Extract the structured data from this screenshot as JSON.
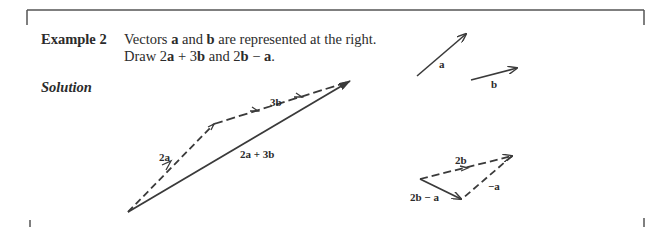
{
  "example": {
    "label": "Example 2",
    "line1_pre": "Vectors ",
    "line1_a": "a",
    "line1_mid": " and ",
    "line1_b": "b",
    "line1_post": " are represented at the right.",
    "line2_pre": "Draw 2",
    "line2_a": "a",
    "line2_plus": " + 3",
    "line2_b": "b",
    "line2_and": " and 2",
    "line2_b2": "b",
    "line2_minus": " − ",
    "line2_a2": "a",
    "line2_end": "."
  },
  "solution": {
    "label": "Solution"
  },
  "figure_labels": {
    "a": "a",
    "b": "b",
    "two_a": "2a",
    "three_b": "3b",
    "sum": "2a + 3b",
    "two_b": "2b",
    "neg_a": "−a",
    "diff": "2b − a"
  },
  "colors": {
    "ink": "#3a3a3a",
    "frame": "#555555"
  }
}
